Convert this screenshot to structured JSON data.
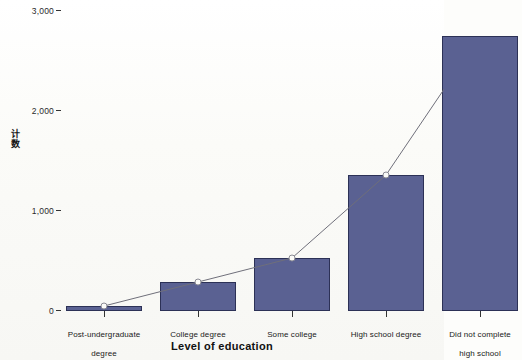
{
  "chart_data": {
    "type": "bar",
    "title": "",
    "subtitle": "",
    "xlabel": "Level of education",
    "ylabel": "计数",
    "categories": [
      "Post-undergraduate degree",
      "College degree",
      "Some college",
      "High school degree",
      "Did not complete high school"
    ],
    "values": [
      50,
      290,
      530,
      1360,
      2750
    ],
    "series": [
      {
        "name": "Count bars",
        "type": "bar",
        "values": [
          50,
          290,
          530,
          1360,
          2750
        ]
      },
      {
        "name": "Count line",
        "type": "line",
        "values": [
          50,
          290,
          530,
          1360,
          2750
        ]
      }
    ],
    "ylim": [
      0,
      3000
    ],
    "ytick_labels": [
      "0",
      "1,000",
      "2,000",
      "3,000"
    ],
    "ytick_values": [
      0,
      1000,
      2000,
      3000
    ],
    "grid": false,
    "legend": "none",
    "bar_color": "#5a6192",
    "bar_border_color": "#2c3156",
    "line_color": "#6f6f7a",
    "marker_color": "#8a8a93",
    "axis_color": "#333333",
    "background_color": "#fdfdfb"
  },
  "axes": {
    "y": {
      "label_chars": [
        "计",
        "数"
      ],
      "ticks": [
        {
          "label": "3,000",
          "value": 3000
        },
        {
          "label": "2,000",
          "value": 2000
        },
        {
          "label": "1,000",
          "value": 1000
        },
        {
          "label": "0",
          "value": 0
        }
      ]
    },
    "x": {
      "title": "Level of education",
      "tick_labels": [
        {
          "line1": "Post-undergraduate",
          "line2": "degree"
        },
        {
          "line1": "College degree",
          "line2": ""
        },
        {
          "line1": "Some college",
          "line2": ""
        },
        {
          "line1": "High school degree",
          "line2": ""
        },
        {
          "line1": "Did not complete",
          "line2": "high school"
        }
      ]
    }
  }
}
